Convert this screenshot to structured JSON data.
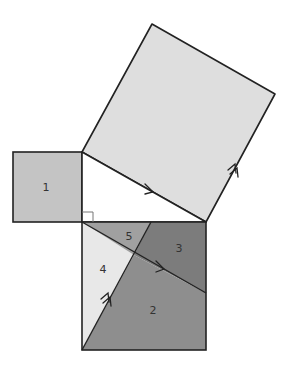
{
  "diagram": {
    "labels": {
      "piece1": "1",
      "piece2": "2",
      "piece3": "3",
      "piece4": "4",
      "piece5": "5"
    },
    "colors": {
      "stroke": "#222222",
      "square_small": "#c4c4c4",
      "square_large": "#dedede",
      "piece2": "#8e8e8e",
      "piece3": "#7c7c7c",
      "piece4": "#e8e8e8",
      "piece5": "#a0a0a0",
      "right_angle_mark": "#777777"
    }
  }
}
